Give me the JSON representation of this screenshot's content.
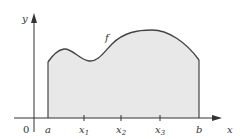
{
  "figure": {
    "function_label": "f",
    "axis_labels": {
      "x": "x",
      "y": "y"
    },
    "origin_label": "0",
    "ticks": [
      {
        "label": "a",
        "sub": ""
      },
      {
        "label": "x",
        "sub": "1"
      },
      {
        "label": "x",
        "sub": "2"
      },
      {
        "label": "x",
        "sub": "3"
      },
      {
        "label": "b",
        "sub": ""
      }
    ],
    "colors": {
      "fill": "#e8e8e8",
      "curve": "#444444",
      "axis": "#333333"
    }
  }
}
